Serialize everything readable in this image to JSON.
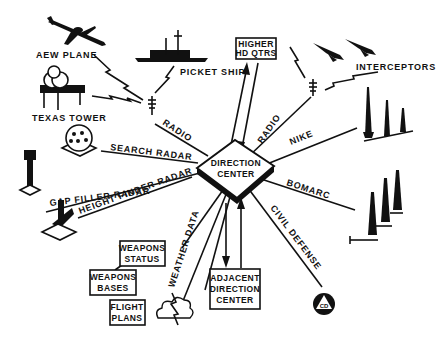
{
  "center": {
    "line1": "DIRECTION",
    "line2": "CENTER"
  },
  "nodes": {
    "aew_plane": "AEW PLANE",
    "picket_ship": "PICKET SHIP",
    "texas_tower": "TEXAS TOWER",
    "higher_hq": {
      "line1": "HIGHER",
      "line2": "HD QTRS"
    },
    "interceptors": "INTERCEPTORS",
    "weapons_status": {
      "line1": "WEAPONS",
      "line2": "STATUS"
    },
    "weapons_bases": {
      "line1": "WEAPONS",
      "line2": "BASES"
    },
    "flight_plans": {
      "line1": "FLIGHT",
      "line2": "PLANS"
    },
    "adjacent_dc": {
      "line1": "ADJACENT",
      "line2": "DIRECTION",
      "line3": "CENTER"
    },
    "civil_defense_emblem": "CD"
  },
  "links": {
    "radio_left": "RADIO",
    "radio_right": "RADIO",
    "search_radar": "SEARCH RADAR",
    "gap_filler_radar": "GAP FILLER RADAR",
    "height_finder_radar": "HEIGHT FINDER RADAR",
    "nike": "NIKE",
    "bomarc": "BOMARC",
    "civil_defense": "CIVIL DEFENSE",
    "weather_data": "WEATHER DATA"
  }
}
